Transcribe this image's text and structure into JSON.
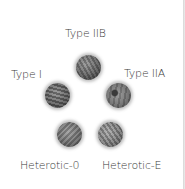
{
  "diagram": {
    "type": "string-theory-types",
    "nodes": [
      {
        "id": "type-iib",
        "label": "Type IIB",
        "icon": "textured-sphere-icon"
      },
      {
        "id": "type-i",
        "label": "Type I",
        "icon": "textured-sphere-icon"
      },
      {
        "id": "type-iia",
        "label": "Type IIA",
        "icon": "textured-sphere-icon"
      },
      {
        "id": "heterotic-o",
        "label": "Heterotic-0",
        "icon": "textured-sphere-icon"
      },
      {
        "id": "heterotic-e",
        "label": "Heterotic-E",
        "icon": "textured-sphere-icon"
      }
    ],
    "colors": {
      "background": "#ffffff",
      "label": "#3a3a3a",
      "sphere": "#707070",
      "edge_line": "#d6d6d6"
    }
  }
}
